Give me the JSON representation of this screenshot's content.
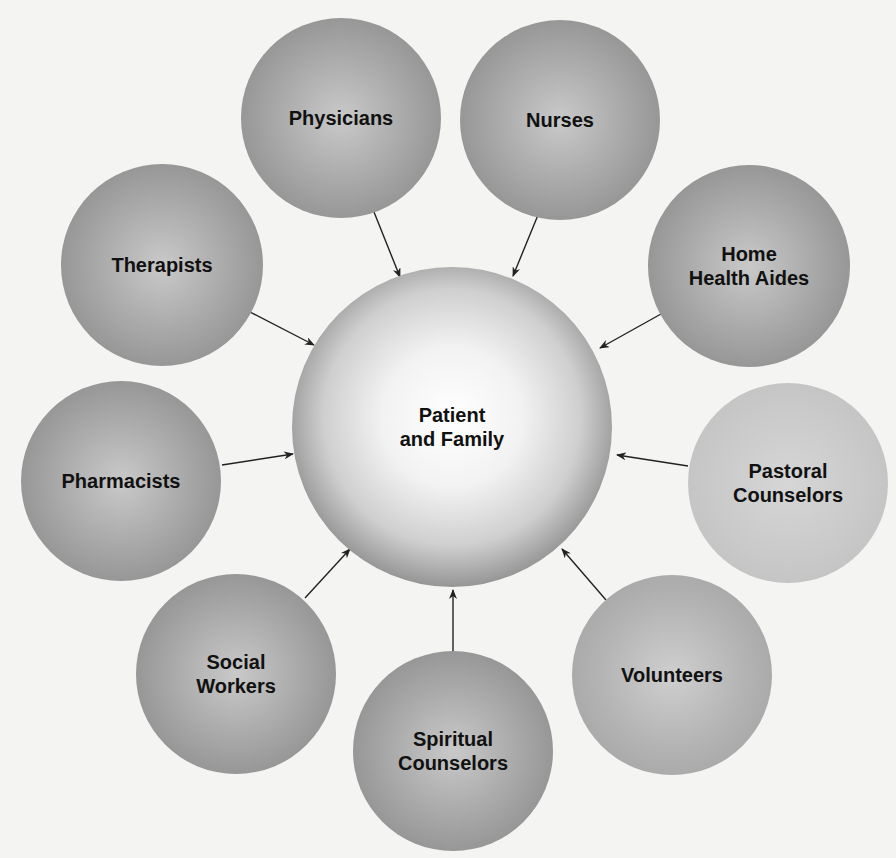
{
  "diagram": {
    "type": "hub-and-spoke",
    "center": {
      "label": "Patient\nand Family",
      "cx": 452,
      "cy": 427,
      "r": 160
    },
    "nodes": [
      {
        "id": "physicians",
        "label": "Physicians",
        "cx": 341,
        "cy": 118,
        "r": 100,
        "shade": "dark"
      },
      {
        "id": "nurses",
        "label": "Nurses",
        "cx": 560,
        "cy": 120,
        "r": 100,
        "shade": "dark"
      },
      {
        "id": "therapists",
        "label": "Therapists",
        "cx": 162,
        "cy": 265,
        "r": 101,
        "shade": "dark"
      },
      {
        "id": "home-health-aides",
        "label": "Home\nHealth Aides",
        "cx": 749,
        "cy": 266,
        "r": 101,
        "shade": "dark"
      },
      {
        "id": "pharmacists",
        "label": "Pharmacists",
        "cx": 121,
        "cy": 481,
        "r": 100,
        "shade": "dark"
      },
      {
        "id": "pastoral-counselors",
        "label": "Pastoral\nCounselors",
        "cx": 788,
        "cy": 483,
        "r": 100,
        "shade": "light"
      },
      {
        "id": "social-workers",
        "label": "Social\nWorkers",
        "cx": 236,
        "cy": 674,
        "r": 100,
        "shade": "dark"
      },
      {
        "id": "spiritual-counselors",
        "label": "Spiritual\nCounselors",
        "cx": 453,
        "cy": 751,
        "r": 100,
        "shade": "dark"
      },
      {
        "id": "volunteers",
        "label": "Volunteers",
        "cx": 672,
        "cy": 675,
        "r": 100,
        "shade": "mid"
      }
    ],
    "arrows": [
      {
        "from": "physicians",
        "x1": 374,
        "y1": 212,
        "x2": 400,
        "y2": 277
      },
      {
        "from": "nurses",
        "x1": 538,
        "y1": 215,
        "x2": 513,
        "y2": 276
      },
      {
        "from": "therapists",
        "x1": 250,
        "y1": 312,
        "x2": 314,
        "y2": 345
      },
      {
        "from": "home-health-aides",
        "x1": 661,
        "y1": 314,
        "x2": 600,
        "y2": 348
      },
      {
        "from": "pharmacists",
        "x1": 222,
        "y1": 465,
        "x2": 293,
        "y2": 454
      },
      {
        "from": "pastoral-counselors",
        "x1": 688,
        "y1": 466,
        "x2": 617,
        "y2": 455
      },
      {
        "from": "social-workers",
        "x1": 305,
        "y1": 598,
        "x2": 350,
        "y2": 549
      },
      {
        "from": "spiritual-counselors",
        "x1": 453,
        "y1": 653,
        "x2": 453,
        "y2": 590
      },
      {
        "from": "volunteers",
        "x1": 606,
        "y1": 600,
        "x2": 562,
        "y2": 549
      }
    ],
    "colors": {
      "background": "#f4f4f2",
      "arrow": "#222222",
      "text": "#111111"
    }
  }
}
